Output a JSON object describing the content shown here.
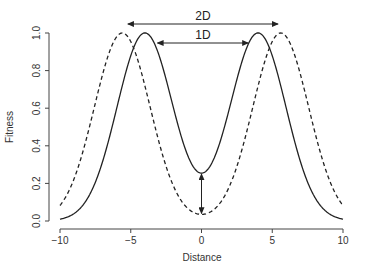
{
  "chart_data": {
    "type": "line",
    "title": "",
    "xlabel": "Distance",
    "ylabel": "Fitness",
    "xlim": [
      -10,
      10
    ],
    "ylim": [
      0,
      1
    ],
    "grid": false,
    "legend": null,
    "x_ticks": [
      -10,
      -5,
      0,
      5,
      10
    ],
    "x_tick_labels": [
      "−10",
      "−5",
      "0",
      "5",
      "10"
    ],
    "y_ticks": [
      0.0,
      0.2,
      0.4,
      0.6,
      0.8,
      1.0
    ],
    "y_tick_labels": [
      "0.0",
      "0.2",
      "0.4",
      "0.6",
      "0.8",
      "1.0"
    ],
    "series": [
      {
        "name": "1D separation",
        "style": "solid",
        "model": "sum of two Gaussians",
        "peaks": [
          -4.0,
          4.0
        ],
        "sigma": 1.97,
        "x": [
          -10,
          -8,
          -6,
          -5,
          -4,
          -3,
          -2,
          -1,
          0,
          1,
          2,
          3,
          4,
          5,
          6,
          8,
          10
        ],
        "values": [
          0.01,
          0.13,
          0.6,
          0.88,
          1.0,
          0.88,
          0.6,
          0.35,
          0.26,
          0.35,
          0.6,
          0.88,
          1.0,
          0.88,
          0.6,
          0.13,
          0.01
        ]
      },
      {
        "name": "2D separation",
        "style": "dashed",
        "model": "sum of two Gaussians",
        "peaks": [
          -5.6,
          5.6
        ],
        "sigma": 1.97,
        "x": [
          -10,
          -8,
          -6,
          -5.6,
          -5,
          -4,
          -2,
          -1,
          0,
          1,
          2,
          4,
          5,
          5.6,
          6,
          8,
          10
        ],
        "values": [
          0.08,
          0.48,
          0.98,
          1.0,
          0.95,
          0.72,
          0.19,
          0.08,
          0.03,
          0.08,
          0.19,
          0.72,
          0.95,
          1.0,
          0.98,
          0.48,
          0.08
        ]
      }
    ],
    "annotations": [
      {
        "label": "2D",
        "type": "double-arrow",
        "from_x": -5.2,
        "to_x": 5.4,
        "y_px": 24
      },
      {
        "label": "1D",
        "type": "arrow-to-peaks",
        "from_x": -3.1,
        "to_x": 3.3,
        "y_px": 43
      },
      {
        "label": "",
        "type": "double-arrow-vertical",
        "x": 0,
        "from_y": 0.03,
        "to_y": 0.26
      }
    ]
  }
}
